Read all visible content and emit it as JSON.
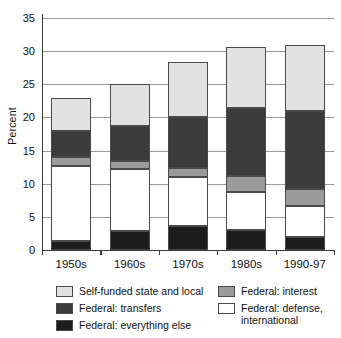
{
  "chart_data": {
    "type": "bar",
    "subtype": "stacked-bar",
    "title": "",
    "xlabel": "",
    "ylabel": "Percent",
    "ylim": [
      0,
      35
    ],
    "ytick_step": 5,
    "yticks": [
      "0",
      "5",
      "10",
      "15",
      "20",
      "25",
      "30",
      "35"
    ],
    "grid": "horizontal",
    "legend_position": "bottom",
    "categories": [
      "1950s",
      "1960s",
      "1970s",
      "1980s",
      "1990-97"
    ],
    "series": [
      {
        "name": "Federal: everything else",
        "color": "#1c1c1c",
        "stack_order": 1,
        "values": [
          1.4,
          2.8,
          3.6,
          3.0,
          2.0
        ]
      },
      {
        "name": "Federal: defense, international",
        "color": "#ffffff",
        "stack_order": 2,
        "values": [
          11.3,
          9.4,
          7.4,
          5.8,
          4.7
        ]
      },
      {
        "name": "Federal: interest",
        "color": "#9b9b9b",
        "stack_order": 3,
        "values": [
          1.3,
          1.3,
          1.3,
          2.3,
          2.5
        ]
      },
      {
        "name": "Federal: transfers",
        "color": "#3b3b3b",
        "stack_order": 4,
        "values": [
          4.0,
          5.2,
          7.8,
          10.3,
          11.7
        ]
      },
      {
        "name": "Self-funded state and local",
        "color": "#e2e2e2",
        "stack_order": 5,
        "values": [
          5.0,
          6.4,
          8.2,
          9.3,
          10.1
        ]
      }
    ],
    "totals": [
      23.0,
      25.1,
      28.3,
      30.7,
      31.0
    ]
  },
  "legend": {
    "left_column": [
      {
        "label": "Self-funded state and local",
        "color": "#e2e2e2"
      },
      {
        "label": "Federal: transfers",
        "color": "#3b3b3b"
      },
      {
        "label": "Federal: everything else",
        "color": "#1c1c1c"
      }
    ],
    "right_column": [
      {
        "label": "Federal: interest",
        "color": "#9b9b9b"
      },
      {
        "label": "Federal: defense, international",
        "color": "#ffffff"
      }
    ]
  },
  "colors": {
    "self_funded": "#e2e2e2",
    "transfers": "#3b3b3b",
    "everything_else": "#1c1c1c",
    "interest": "#9b9b9b",
    "defense": "#ffffff",
    "gridline": "#9a9a9a",
    "axis": "#3a3a3a",
    "background": "#ffffff"
  }
}
